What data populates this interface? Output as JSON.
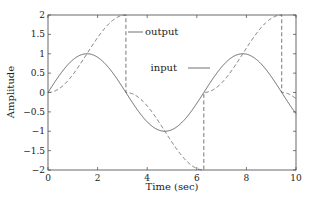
{
  "chart_data": {
    "type": "line",
    "title": "",
    "xlabel": "Time (sec)",
    "ylabel": "Amplitude",
    "xlim": [
      0,
      10
    ],
    "ylim": [
      -2,
      2
    ],
    "xticks": [
      0,
      2,
      4,
      6,
      8,
      10
    ],
    "yticks": [
      -2,
      -1.5,
      -1,
      -0.5,
      0,
      0.5,
      1,
      1.5,
      2
    ],
    "xtick_labels": [
      "0",
      "2",
      "4",
      "6",
      "8",
      "10"
    ],
    "ytick_labels": [
      "−2",
      "−1.5",
      "−1",
      "−0.5",
      "0",
      "0.5",
      "1",
      "1.5",
      "2"
    ],
    "grid": false,
    "legend": null,
    "series": [
      {
        "name": "input",
        "style": "solid",
        "color": "#555555",
        "description": "sin(t)",
        "x": [
          0,
          0.5,
          1,
          1.5,
          2,
          2.5,
          3,
          3.5,
          4,
          4.5,
          5,
          5.5,
          6,
          6.5,
          7,
          7.5,
          8,
          8.5,
          9,
          9.5,
          10
        ],
        "y": [
          0,
          0.48,
          0.84,
          1.0,
          0.91,
          0.6,
          0.14,
          -0.35,
          -0.76,
          -0.98,
          -0.96,
          -0.71,
          -0.28,
          0.22,
          0.66,
          0.94,
          0.99,
          0.8,
          0.41,
          -0.08,
          -0.54
        ]
      },
      {
        "name": "output",
        "style": "dashed",
        "color": "#666666",
        "description": "wrapped to [-2,2]; jumps at t=pi, 2pi, 3pi",
        "x": [
          0,
          0.5,
          1,
          1.5,
          2,
          2.5,
          3,
          3.14,
          3.14,
          3.5,
          4,
          4.5,
          5,
          5.5,
          6,
          6.28,
          6.28,
          6.5,
          7,
          7.5,
          8,
          8.5,
          9,
          9.42,
          9.42,
          9.5,
          10
        ],
        "y": [
          0,
          0.12,
          0.46,
          0.93,
          1.42,
          1.8,
          1.99,
          2.0,
          0,
          -0.06,
          -0.35,
          -0.79,
          -1.28,
          -1.71,
          -1.96,
          -2.0,
          0,
          0.02,
          0.25,
          0.65,
          1.15,
          1.6,
          1.91,
          2.0,
          0,
          0.0,
          -0.16
        ]
      }
    ],
    "annotations": [
      {
        "text": "output",
        "x": 3.14,
        "y": 1.6,
        "arrow": true
      },
      {
        "text": "input",
        "x": 5.5,
        "y": 0.95,
        "arrow": true
      }
    ]
  },
  "labels": {
    "xlabel": "Time (sec)",
    "ylabel": "Amplitude",
    "output_annotation": "output",
    "input_annotation": "input"
  }
}
